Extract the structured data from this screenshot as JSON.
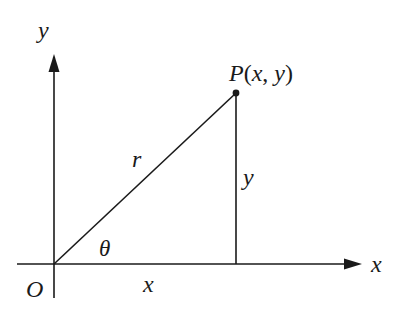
{
  "diagram": {
    "title": "",
    "type": "polar-coordinates-right-triangle",
    "colors": {
      "line": "#1a1a1a",
      "background": "#ffffff"
    },
    "labels": {
      "y_axis": "y",
      "x_axis": "x",
      "origin": "O",
      "point": "P",
      "point_open": "(",
      "point_x": "x",
      "point_comma": ", ",
      "point_y": "y",
      "point_close": ")",
      "hypotenuse": "r",
      "vertical_side": "y",
      "horizontal_side": "x",
      "angle": "θ"
    },
    "geometry": {
      "origin": [
        54,
        264
      ],
      "point_P": [
        236,
        93
      ],
      "foot": [
        236,
        264
      ],
      "x_axis_from": [
        17,
        264
      ],
      "x_axis_to": [
        360,
        264
      ],
      "y_axis_from": [
        54,
        297
      ],
      "y_axis_to": [
        54,
        55
      ]
    }
  }
}
